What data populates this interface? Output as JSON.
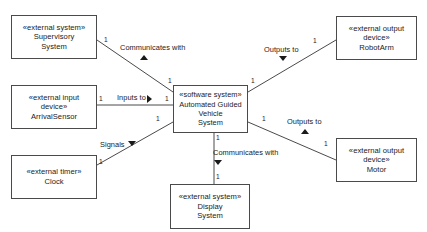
{
  "diagram": {
    "type": "uml-context-class-diagram",
    "background": "#ffffff",
    "line_color": "#4a4a4a",
    "text_color": "#1a1a1a"
  },
  "nodes": [
    {
      "id": "supervisory",
      "stereotype": "«external system»",
      "name_line1": "Supervisory",
      "name_line2": "System",
      "x": 11,
      "y": 15,
      "w": 86,
      "h": 44
    },
    {
      "id": "arrival_sensor",
      "stereotype": "«external input",
      "name_line1": "device»",
      "name_line2": "ArrivalSensor",
      "x": 11,
      "y": 85,
      "w": 86,
      "h": 44
    },
    {
      "id": "clock",
      "stereotype": "«external timer»",
      "name_line1": "Clock",
      "name_line2": "",
      "x": 11,
      "y": 155,
      "w": 86,
      "h": 44
    },
    {
      "id": "agv",
      "stereotype": "«software system»",
      "name_line1": "Automated Guided Vehicle",
      "name_line2": "System",
      "x": 173,
      "y": 85,
      "w": 75,
      "h": 48
    },
    {
      "id": "robot_arm",
      "stereotype": "«external output",
      "name_line1": "device»",
      "name_line2": "RobotArm",
      "x": 336,
      "y": 16,
      "w": 81,
      "h": 44
    },
    {
      "id": "motor",
      "stereotype": "«external output",
      "name_line1": "device»",
      "name_line2": "Motor",
      "x": 336,
      "y": 138,
      "w": 81,
      "h": 44
    },
    {
      "id": "display",
      "stereotype": "«external system»",
      "name_line1": "Display",
      "name_line2": "System",
      "x": 170,
      "y": 184,
      "w": 80,
      "h": 45
    }
  ],
  "edges": [
    {
      "id": "supervisory-agv",
      "label": "Communicates with",
      "label_x": 120,
      "label_y": 43,
      "arrow": "up",
      "arrow_x": 140,
      "arrow_y": 55,
      "x1": 97,
      "y1": 40,
      "x2": 173,
      "y2": 92
    },
    {
      "id": "arrivalsensor-agv",
      "label": "Inputs to",
      "label_x": 117,
      "label_y": 93,
      "arrow": "right",
      "arrow_x": 147,
      "arrow_y": 95,
      "x1": 97,
      "y1": 105,
      "x2": 173,
      "y2": 105
    },
    {
      "id": "clock-agv",
      "label": "Signals",
      "label_x": 100,
      "label_y": 140,
      "arrow": "down",
      "arrow_x": 128,
      "arrow_y": 141,
      "x1": 97,
      "y1": 165,
      "x2": 173,
      "y2": 122
    },
    {
      "id": "agv-robotarm",
      "label": "Outputs to",
      "label_x": 264,
      "label_y": 45,
      "arrow": "down",
      "arrow_x": 279,
      "arrow_y": 56,
      "x1": 248,
      "y1": 92,
      "x2": 336,
      "y2": 40
    },
    {
      "id": "agv-motor",
      "label": "Outputs to",
      "label_x": 287,
      "label_y": 117,
      "arrow": "up",
      "arrow_x": 301,
      "arrow_y": 129,
      "x1": 248,
      "y1": 122,
      "x2": 336,
      "y2": 160
    },
    {
      "id": "agv-display",
      "label": "Communicates with",
      "label_x": 213,
      "label_y": 148,
      "arrow": "down",
      "arrow_x": 214,
      "arrow_y": 160,
      "x1": 214,
      "y1": 133,
      "x2": 214,
      "y2": 184
    }
  ],
  "multiplicities": [
    {
      "id": "m-supervisory",
      "value": "1",
      "x": 104,
      "y": 36
    },
    {
      "id": "m-agv-top-left",
      "value": "1",
      "x": 168,
      "y": 77
    },
    {
      "id": "m-arrivalsensor",
      "value": "1",
      "x": 99,
      "y": 95
    },
    {
      "id": "m-agv-left",
      "value": "1",
      "x": 165,
      "y": 95
    },
    {
      "id": "m-agv-bottom-left",
      "value": "1",
      "x": 156,
      "y": 115
    },
    {
      "id": "m-clock",
      "value": "1",
      "x": 99,
      "y": 158
    },
    {
      "id": "m-agv-top-right",
      "value": "1",
      "x": 251,
      "y": 77
    },
    {
      "id": "m-robotarm",
      "value": "1",
      "x": 313,
      "y": 37
    },
    {
      "id": "m-agv-right",
      "value": "1",
      "x": 262,
      "y": 115
    },
    {
      "id": "m-motor",
      "value": "1",
      "x": 324,
      "y": 140
    },
    {
      "id": "m-agv-bottom",
      "value": "1",
      "x": 216,
      "y": 134
    },
    {
      "id": "m-display",
      "value": "1",
      "x": 216,
      "y": 173
    }
  ]
}
